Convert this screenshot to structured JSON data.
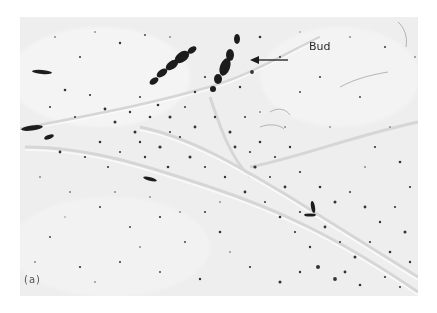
{
  "figure": {
    "panel_label": "(a)",
    "annotations": [
      {
        "text": "Bud",
        "arrow_direction": "left"
      }
    ],
    "colors": {
      "background": "#efefef",
      "stain": "#1e1e1e",
      "page": "#ffffff"
    }
  }
}
